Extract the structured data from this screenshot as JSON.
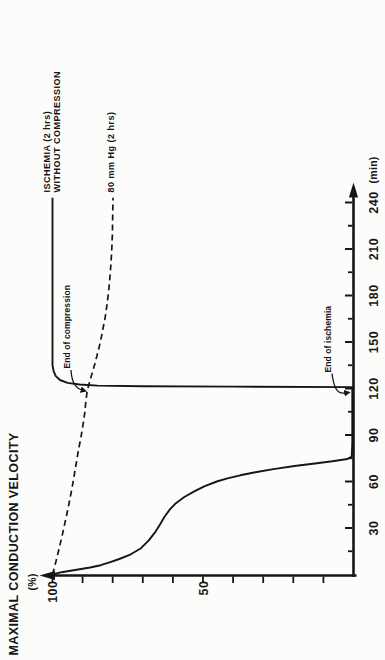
{
  "figure": {
    "y_axis_title": "MAXIMAL CONDUCTION VELOCITY",
    "y_axis_unit": "(%)",
    "x_axis_unit": "(min)"
  },
  "curve_labels": {
    "solid_line1": "ISCHEMIA (2 hrs)",
    "solid_line2": "WITHOUT COMPRESSION",
    "dashed": "80 mm Hg (2 hrs)"
  },
  "annotations": {
    "end_of_compression": "End of compression",
    "end_of_ischemia": "End of ischemia"
  },
  "colors": {
    "ink": "#161616",
    "background": "#fcfcfb"
  },
  "chart_data": {
    "type": "line",
    "orientation_note": "entire figure printed rotated 90 degrees counter-clockwise",
    "title": "",
    "xlabel": "(min)",
    "ylabel": "MAXIMAL CONDUCTION VELOCITY (%)",
    "xlim": [
      0,
      265
    ],
    "ylim": [
      0,
      104
    ],
    "x_ticks_major": [
      30,
      60,
      90,
      120,
      150,
      180,
      210,
      240
    ],
    "x_ticks_minor": [
      15,
      45,
      75,
      105,
      135,
      165,
      195,
      225
    ],
    "y_ticks": [
      10,
      20,
      30,
      40,
      50,
      60,
      70,
      80,
      90,
      100
    ],
    "y_tick_labeled": [
      50,
      100
    ],
    "grid": false,
    "annotations": [
      {
        "label": "End of compression",
        "x": 120,
        "y": 88.5,
        "target": "dashed curve at end of 2 hr compression"
      },
      {
        "label": "End of ischemia",
        "x": 120,
        "y": 0,
        "target": "time axis at end of 2 hr ischemia"
      }
    ],
    "series": [
      {
        "name": "ISCHEMIA (2 hrs) WITHOUT COMPRESSION",
        "style": "solid",
        "points": [
          [
            0,
            100
          ],
          [
            1.5,
            97
          ],
          [
            3,
            92
          ],
          [
            4.5,
            87.5
          ],
          [
            6,
            84
          ],
          [
            8,
            80.8
          ],
          [
            10,
            77.8
          ],
          [
            13,
            74
          ],
          [
            17,
            70.6
          ],
          [
            22,
            68
          ],
          [
            27,
            66
          ],
          [
            32,
            64.4
          ],
          [
            37,
            62.9
          ],
          [
            42,
            61
          ],
          [
            46,
            59
          ],
          [
            50,
            56.2
          ],
          [
            54,
            52.6
          ],
          [
            57,
            49.4
          ],
          [
            60,
            45.4
          ],
          [
            62,
            41.9
          ],
          [
            64,
            37.6
          ],
          [
            66,
            32.6
          ],
          [
            68,
            26.6
          ],
          [
            70,
            19.6
          ],
          [
            71.5,
            13.5
          ],
          [
            73,
            7
          ],
          [
            74.5,
            2
          ],
          [
            76,
            0.6
          ],
          [
            85,
            0.4
          ],
          [
            95,
            0.4
          ],
          [
            105,
            0.4
          ],
          [
            115,
            0.4
          ],
          [
            120.9,
            0.4
          ],
          [
            121.2,
            40
          ],
          [
            121.5,
            70
          ],
          [
            121.9,
            85
          ],
          [
            122.6,
            91
          ],
          [
            123.6,
            95
          ],
          [
            125.5,
            97.5
          ],
          [
            128,
            98.9
          ],
          [
            131,
            99.6
          ],
          [
            135,
            100
          ],
          [
            160,
            100
          ],
          [
            200,
            100
          ],
          [
            243,
            100
          ]
        ]
      },
      {
        "name": "80 mm Hg (2 hrs)",
        "style": "dashed",
        "points": [
          [
            0,
            100
          ],
          [
            8,
            98.9
          ],
          [
            16,
            97.9
          ],
          [
            24,
            96.9
          ],
          [
            32,
            96
          ],
          [
            40,
            95.1
          ],
          [
            48,
            94.3
          ],
          [
            56,
            93.5
          ],
          [
            64,
            92.8
          ],
          [
            72,
            92.1
          ],
          [
            80,
            91.4
          ],
          [
            88,
            90.6
          ],
          [
            96,
            89.9
          ],
          [
            104,
            89.3
          ],
          [
            112,
            88.9
          ],
          [
            118,
            88.5
          ],
          [
            124,
            87.7
          ],
          [
            130,
            86.8
          ],
          [
            136,
            85.9
          ],
          [
            142,
            85.1
          ],
          [
            150,
            84.1
          ],
          [
            158,
            83.3
          ],
          [
            166,
            82.5
          ],
          [
            174,
            81.9
          ],
          [
            182,
            81.4
          ],
          [
            190,
            81
          ],
          [
            200,
            80.6
          ],
          [
            210,
            80.3
          ],
          [
            220,
            80.1
          ],
          [
            232,
            80
          ],
          [
            243,
            79.9
          ]
        ]
      }
    ]
  }
}
